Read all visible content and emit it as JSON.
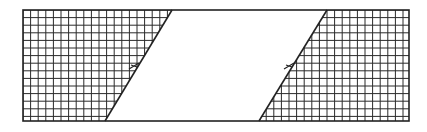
{
  "diagram": {
    "title": "",
    "canvas": {
      "width": 427,
      "height": 132,
      "background": "#ffffff"
    },
    "outer_rect": {
      "x1": 23,
      "y1": 10,
      "x2": 409,
      "y2": 121
    },
    "stroke_color": "#222222",
    "grid": {
      "spacing": 7.6,
      "color": "#2a2a2a",
      "width": 1
    },
    "left_region": {
      "label": "",
      "diag_top_x": 172,
      "diag_bottom_x": 105
    },
    "right_region": {
      "label": "",
      "diag_top_x": 327,
      "diag_bottom_x": 259
    },
    "break_marks": [
      {
        "cx": 134,
        "cy": 66
      },
      {
        "cx": 289,
        "cy": 66
      }
    ]
  }
}
